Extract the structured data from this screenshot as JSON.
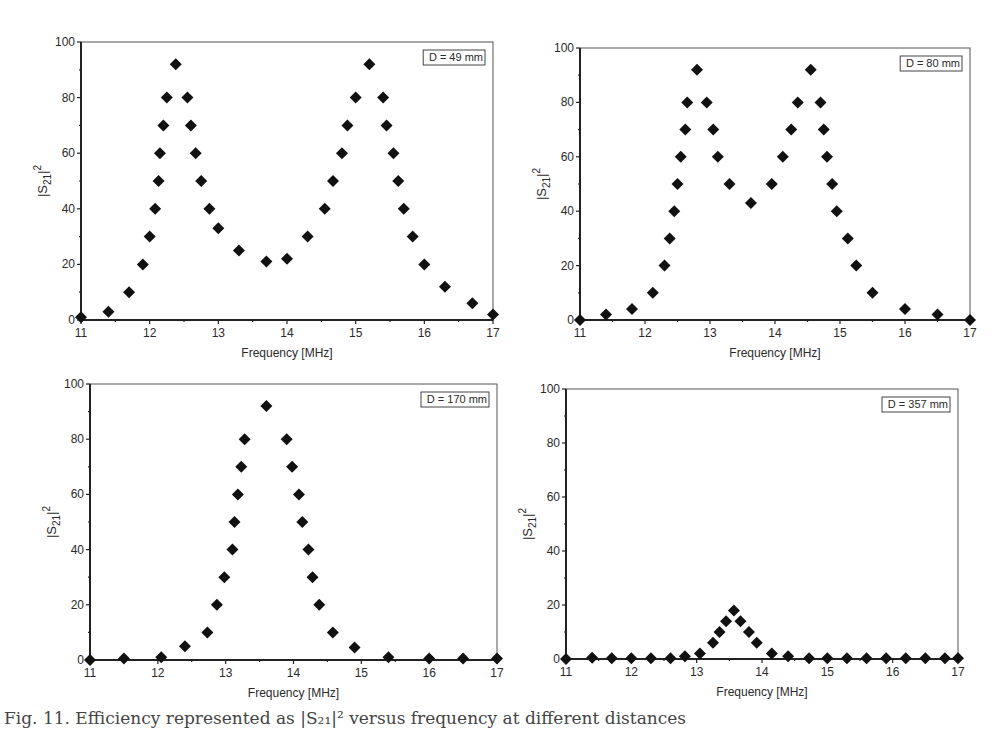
{
  "figure": {
    "caption": "Fig. 11. Efficiency represented as |S₂₁|² versus frequency at different distances"
  },
  "chart_data": [
    {
      "type": "scatter",
      "title": "",
      "legend": "D = 49 mm",
      "xlabel": "Frequency [MHz]",
      "ylabel": "|S21|^2",
      "xlim": [
        11,
        17
      ],
      "ylim": [
        0,
        100
      ],
      "xticks": [
        11,
        12,
        13,
        14,
        15,
        16,
        17
      ],
      "yticks": [
        0,
        20,
        40,
        60,
        80,
        100
      ],
      "grid": false,
      "legend_position": "top-right",
      "marker": "diamond",
      "x": [
        11.0,
        11.4,
        11.7,
        11.9,
        12.0,
        12.08,
        12.13,
        12.15,
        12.2,
        12.25,
        12.38,
        12.55,
        12.6,
        12.67,
        12.75,
        12.87,
        13.0,
        13.3,
        13.7,
        14.0,
        14.3,
        14.55,
        14.67,
        14.8,
        14.88,
        15.0,
        15.2,
        15.4,
        15.45,
        15.55,
        15.62,
        15.7,
        15.83,
        16.0,
        16.3,
        16.7,
        17.0
      ],
      "y": [
        1,
        3,
        10,
        20,
        30,
        40,
        50,
        60,
        70,
        80,
        92,
        80,
        70,
        60,
        50,
        40,
        33,
        25,
        21,
        22,
        30,
        40,
        50,
        60,
        70,
        80,
        92,
        80,
        70,
        60,
        50,
        40,
        30,
        20,
        12,
        6,
        2
      ]
    },
    {
      "type": "scatter",
      "title": "",
      "legend": "D = 80 mm",
      "xlabel": "Frequency [MHz]",
      "ylabel": "|S21|^2",
      "xlim": [
        11,
        17
      ],
      "ylim": [
        0,
        100
      ],
      "xticks": [
        11,
        12,
        13,
        14,
        15,
        16,
        17
      ],
      "yticks": [
        0,
        20,
        40,
        60,
        80,
        100
      ],
      "grid": false,
      "legend_position": "top-right",
      "marker": "diamond",
      "x": [
        11.0,
        11.4,
        11.8,
        12.12,
        12.3,
        12.38,
        12.45,
        12.5,
        12.55,
        12.62,
        12.65,
        12.8,
        12.95,
        13.05,
        13.12,
        13.3,
        13.63,
        13.95,
        14.12,
        14.25,
        14.35,
        14.55,
        14.7,
        14.75,
        14.8,
        14.88,
        14.95,
        15.12,
        15.25,
        15.5,
        16.0,
        16.5,
        17.0
      ],
      "y": [
        0,
        2,
        4,
        10,
        20,
        30,
        40,
        50,
        60,
        70,
        80,
        92,
        80,
        70,
        60,
        50,
        43,
        50,
        60,
        70,
        80,
        92,
        80,
        70,
        60,
        50,
        40,
        30,
        20,
        10,
        4,
        2,
        0
      ]
    },
    {
      "type": "scatter",
      "title": "",
      "legend": "D = 170 mm",
      "xlabel": "Frequency [MHz]",
      "ylabel": "|S21|^2",
      "xlim": [
        11,
        17
      ],
      "ylim": [
        0,
        100
      ],
      "xticks": [
        11,
        12,
        13,
        14,
        15,
        16,
        17
      ],
      "yticks": [
        0,
        20,
        40,
        60,
        80,
        100
      ],
      "grid": false,
      "legend_position": "top-right",
      "marker": "diamond",
      "x": [
        11.0,
        11.5,
        12.05,
        12.4,
        12.73,
        12.87,
        12.98,
        13.1,
        13.13,
        13.18,
        13.23,
        13.28,
        13.6,
        13.9,
        13.98,
        14.08,
        14.13,
        14.22,
        14.28,
        14.38,
        14.58,
        14.9,
        15.4,
        16.0,
        16.5,
        17.0
      ],
      "y": [
        0,
        0.5,
        1,
        5,
        10,
        20,
        30,
        40,
        50,
        60,
        70,
        80,
        92,
        80,
        70,
        60,
        50,
        40,
        30,
        20,
        10,
        4.5,
        1,
        0.5,
        0.5,
        0.5
      ]
    },
    {
      "type": "scatter",
      "title": "",
      "legend": "D = 357 mm",
      "xlabel": "Frequency [MHz]",
      "ylabel": "|S21|^2",
      "xlim": [
        11,
        17
      ],
      "ylim": [
        0,
        100
      ],
      "xticks": [
        11,
        12,
        13,
        14,
        15,
        16,
        17
      ],
      "yticks": [
        0,
        20,
        40,
        60,
        80,
        100
      ],
      "grid": false,
      "legend_position": "top-right",
      "marker": "diamond",
      "x": [
        11.0,
        11.4,
        11.7,
        12.0,
        12.3,
        12.6,
        12.82,
        13.05,
        13.25,
        13.35,
        13.45,
        13.57,
        13.67,
        13.8,
        13.92,
        14.15,
        14.4,
        14.72,
        15.0,
        15.3,
        15.6,
        15.9,
        16.2,
        16.5,
        16.8,
        17.0
      ],
      "y": [
        0,
        0.5,
        0.3,
        0.3,
        0.3,
        0.3,
        1,
        2,
        6,
        10,
        14,
        18,
        14,
        10,
        6,
        2,
        1,
        0.3,
        0.3,
        0.3,
        0.3,
        0.3,
        0.3,
        0.3,
        0.3,
        0.3
      ]
    }
  ],
  "layout": {
    "panels": [
      {
        "left": 81,
        "top": 42,
        "right": 493,
        "bottom": 320
      },
      {
        "left": 580,
        "top": 48,
        "right": 970,
        "bottom": 320
      },
      {
        "left": 90,
        "top": 384,
        "right": 497,
        "bottom": 660
      },
      {
        "left": 566,
        "top": 389,
        "right": 958,
        "bottom": 659
      }
    ],
    "colors": {
      "marker": "#111111",
      "axis": "#222222",
      "frame": "#555555"
    }
  }
}
